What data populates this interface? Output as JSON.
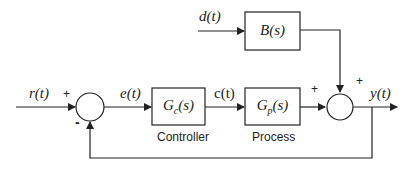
{
  "diagram": {
    "type": "feedback-control-block-diagram",
    "signals": {
      "reference": "r(t)",
      "error": "e(t)",
      "control": "c(t)",
      "disturbance": "d(t)",
      "output": "y(t)"
    },
    "blocks": {
      "controller": {
        "tf_main": "G",
        "tf_sub": "c",
        "tf_arg": "(s)",
        "caption": "Controller"
      },
      "process": {
        "tf_main": "G",
        "tf_sub": "p",
        "tf_arg": "(s)",
        "caption": "Process"
      },
      "disturbance": {
        "tf": "B(s)"
      }
    },
    "summing_junctions": {
      "left": {
        "plus_sign": "+",
        "minus_sign": "-"
      },
      "right": {
        "plus_left": "+",
        "plus_top": "+"
      }
    },
    "colors": {
      "line": "#222222",
      "background": "#ffffff"
    }
  }
}
